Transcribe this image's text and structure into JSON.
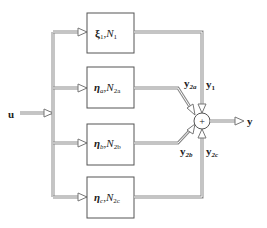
{
  "diagram": {
    "type": "block-diagram",
    "input": {
      "label": "u"
    },
    "output": {
      "label": "y"
    },
    "summing_junction": {
      "symbol": "+"
    },
    "blocks": [
      {
        "id": "block-1",
        "param": "ξ",
        "param_sub": "1",
        "sep": ",",
        "model": "N",
        "model_sub": "1",
        "output_label": "y",
        "output_sub": "1"
      },
      {
        "id": "block-2a",
        "param": "η",
        "param_sub": "a",
        "sep": ",",
        "model": "N",
        "model_sub": "2a",
        "output_label": "y",
        "output_sub": "2a"
      },
      {
        "id": "block-2b",
        "param": "η",
        "param_sub": "b",
        "sep": ",",
        "model": "N",
        "model_sub": "2b",
        "output_label": "y",
        "output_sub": "2b"
      },
      {
        "id": "block-2c",
        "param": "η",
        "param_sub": "c",
        "sep": ",",
        "model": "N",
        "model_sub": "2c",
        "output_label": "y",
        "output_sub": "2c"
      }
    ],
    "colors": {
      "line": "#8a8a8a",
      "box": "#555555",
      "text": "#222222",
      "background": "#ffffff"
    }
  }
}
